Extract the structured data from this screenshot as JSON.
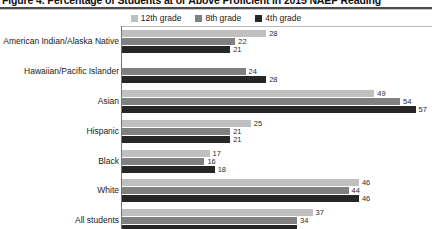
{
  "figure": {
    "title": "Figure 4. Percentage of Students at or Above Proficient in 2015 NAEP Reading"
  },
  "legend": {
    "position": "top-center",
    "items": [
      {
        "label": "12th grade",
        "color": "#bfbfbf",
        "swatch_name": "legend-swatch-12th-grade"
      },
      {
        "label": "8th grade",
        "color": "#808080",
        "swatch_name": "legend-swatch-8th-grade"
      },
      {
        "label": "4th grade",
        "color": "#262626",
        "swatch_name": "legend-swatch-4th-grade"
      }
    ]
  },
  "colors": {
    "grade12": "#bfbfbf",
    "grade8": "#808080",
    "grade4": "#262626",
    "axis": "#777777",
    "title_rule": "#4a4a4a"
  },
  "chart_data": {
    "type": "bar",
    "orientation": "horizontal",
    "title": "Figure 4. Percentage of Students at or Above Proficient in 2015 NAEP Reading",
    "xlabel": "",
    "ylabel": "",
    "xlim": [
      0,
      60
    ],
    "grid": false,
    "legend_position": "top-center",
    "value_labels": true,
    "categories": [
      "American Indian/Alaska Native",
      "Hawaiian/Pacific Islander",
      "Asian",
      "Hispanic",
      "Black",
      "White",
      "All students"
    ],
    "series": [
      {
        "name": "12th grade",
        "color": "#bfbfbf",
        "values": [
          28,
          null,
          49,
          25,
          17,
          46,
          37
        ]
      },
      {
        "name": "8th grade",
        "color": "#808080",
        "values": [
          22,
          24,
          54,
          21,
          16,
          44,
          34
        ]
      },
      {
        "name": "4th grade",
        "color": "#262626",
        "values": [
          21,
          28,
          57,
          21,
          18,
          46,
          34
        ]
      }
    ]
  },
  "groups": [
    {
      "label": "American Indian/Alaska Native",
      "bars": [
        {
          "grade": "12th grade",
          "value": 28,
          "text": "28",
          "color": "#bfbfbf"
        },
        {
          "grade": "8th grade",
          "value": 22,
          "text": "22",
          "color": "#808080"
        },
        {
          "grade": "4th grade",
          "value": 21,
          "text": "21",
          "color": "#262626"
        }
      ]
    },
    {
      "label": "Hawaiian/Pacific Islander",
      "bars": [
        {
          "grade": "12th grade",
          "value": null,
          "text": "",
          "color": "#bfbfbf"
        },
        {
          "grade": "8th grade",
          "value": 24,
          "text": "24",
          "color": "#808080"
        },
        {
          "grade": "4th grade",
          "value": 28,
          "text": "28",
          "color": "#262626"
        }
      ]
    },
    {
      "label": "Asian",
      "bars": [
        {
          "grade": "12th grade",
          "value": 49,
          "text": "49",
          "color": "#bfbfbf"
        },
        {
          "grade": "8th grade",
          "value": 54,
          "text": "54",
          "color": "#808080"
        },
        {
          "grade": "4th grade",
          "value": 57,
          "text": "57",
          "color": "#262626"
        }
      ]
    },
    {
      "label": "Hispanic",
      "bars": [
        {
          "grade": "12th grade",
          "value": 25,
          "text": "25",
          "color": "#bfbfbf"
        },
        {
          "grade": "8th grade",
          "value": 21,
          "text": "21",
          "color": "#808080"
        },
        {
          "grade": "4th grade",
          "value": 21,
          "text": "21",
          "color": "#262626"
        }
      ]
    },
    {
      "label": "Black",
      "bars": [
        {
          "grade": "12th grade",
          "value": 17,
          "text": "17",
          "color": "#bfbfbf"
        },
        {
          "grade": "8th grade",
          "value": 16,
          "text": "16",
          "color": "#808080"
        },
        {
          "grade": "4th grade",
          "value": 18,
          "text": "18",
          "color": "#262626"
        }
      ]
    },
    {
      "label": "White",
      "bars": [
        {
          "grade": "12th grade",
          "value": 46,
          "text": "46",
          "color": "#bfbfbf"
        },
        {
          "grade": "8th grade",
          "value": 44,
          "text": "44",
          "color": "#808080"
        },
        {
          "grade": "4th grade",
          "value": 46,
          "text": "46",
          "color": "#262626"
        }
      ]
    },
    {
      "label": "All students",
      "bars": [
        {
          "grade": "12th grade",
          "value": 37,
          "text": "37",
          "color": "#bfbfbf"
        },
        {
          "grade": "8th grade",
          "value": 34,
          "text": "34",
          "color": "#808080"
        },
        {
          "grade": "4th grade",
          "value": 34,
          "text": "",
          "color": "#262626"
        }
      ]
    }
  ]
}
